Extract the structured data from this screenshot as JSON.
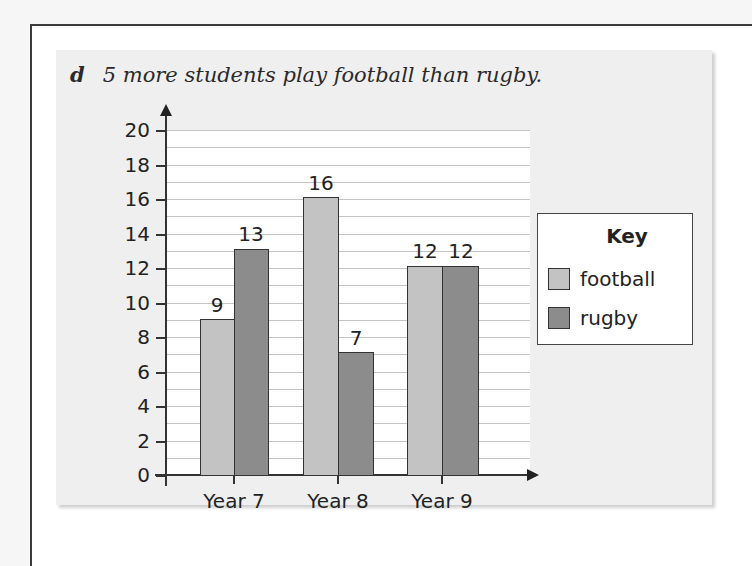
{
  "question": {
    "letter": "d",
    "text": "5 more students play football than rugby."
  },
  "colors": {
    "football": "#c3c3c3",
    "rugby": "#8c8c8c"
  },
  "chart_data": {
    "type": "bar",
    "title": "",
    "xlabel": "",
    "ylabel": "",
    "categories": [
      "Year 7",
      "Year 8",
      "Year 9"
    ],
    "series": [
      {
        "name": "football",
        "values": [
          9,
          16,
          12
        ]
      },
      {
        "name": "rugby",
        "values": [
          13,
          7,
          12
        ]
      }
    ],
    "ylim": [
      0,
      20
    ],
    "yticks": [
      "0",
      "2",
      "4",
      "6",
      "8",
      "10",
      "12",
      "14",
      "16",
      "18",
      "20"
    ],
    "grid": "horizontal, every 1 unit",
    "legend": {
      "title": "Key",
      "position": "right",
      "entries": [
        "football",
        "rugby"
      ]
    },
    "data_labels": true
  },
  "axis": {
    "y_ticks": [
      "0",
      "2",
      "4",
      "6",
      "8",
      "10",
      "12",
      "14",
      "16",
      "18",
      "20"
    ],
    "x_labels": [
      "Year 7",
      "Year 8",
      "Year 9"
    ]
  },
  "bars": [
    {
      "label": "9"
    },
    {
      "label": "13"
    },
    {
      "label": "16"
    },
    {
      "label": "7"
    },
    {
      "label": "12"
    },
    {
      "label": "12"
    }
  ],
  "key": {
    "title": "Key",
    "items": [
      {
        "label": "football"
      },
      {
        "label": "rugby"
      }
    ]
  }
}
